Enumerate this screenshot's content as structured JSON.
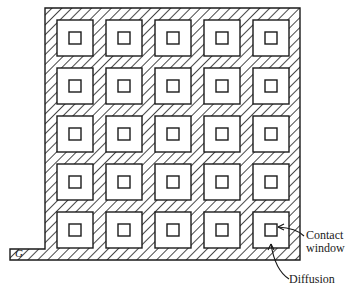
{
  "diagram": {
    "type": "transistor-layout",
    "grid": {
      "rows": 5,
      "cols": 5
    },
    "labels": {
      "gate": "G",
      "contact_line1": "Contact",
      "contact_line2": "window",
      "diffusion": "Diffusion"
    },
    "colors": {
      "line": "#1a1a1a",
      "background": "#ffffff"
    }
  }
}
